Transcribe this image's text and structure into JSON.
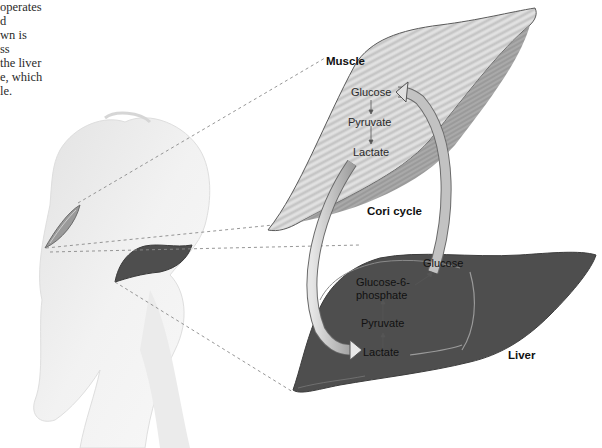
{
  "caption": {
    "lines": [
      "operates",
      "d",
      "wn is",
      "ss",
      "the liver",
      "e, which",
      "le."
    ]
  },
  "labels": {
    "muscle_title": "Muscle",
    "liver_title": "Liver",
    "cycle_title": "Cori cycle"
  },
  "muscle_pathway": {
    "steps": [
      "Glucose",
      "Pyruvate",
      "Lactate"
    ]
  },
  "liver_pathway": {
    "steps": [
      "Lactate",
      "Pyruvate",
      "Glucose-6-",
      "phosphate",
      "Glucose"
    ]
  },
  "colors": {
    "liver_fill": "#4e4e4e",
    "muscle_fill": "#d4d4d4",
    "arrow_fill": "#bdbdbd",
    "body_fill": "#efefef",
    "dashed_line": "#8a8a8a"
  }
}
